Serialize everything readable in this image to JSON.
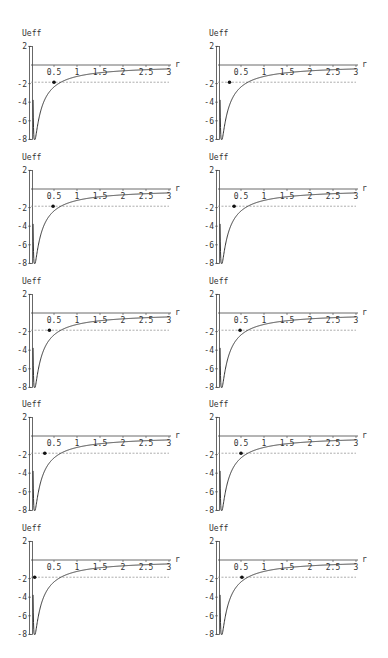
{
  "chart_data": [
    {
      "type": "line",
      "panel": "row1-left",
      "ylabel": "Ueff",
      "xlabel": "r",
      "xlim": [
        0,
        3
      ],
      "ylim": [
        -8,
        2
      ],
      "xticks": [
        "0.5",
        "1",
        "1.5",
        "2",
        "2.5",
        "3"
      ],
      "yticks": [
        "2",
        "-2",
        "-4",
        "-6",
        "-8"
      ],
      "energy_level": -1.85,
      "point": {
        "r": 0.5,
        "U": -1.85
      }
    },
    {
      "type": "line",
      "panel": "row1-right",
      "ylabel": "Ueff",
      "xlabel": "r",
      "xlim": [
        0,
        3
      ],
      "ylim": [
        -8,
        2
      ],
      "xticks": [
        "0.5",
        "1",
        "1.5",
        "2",
        "2.5",
        "3"
      ],
      "yticks": [
        "2",
        "-2",
        "-4",
        "-6",
        "-8"
      ],
      "energy_level": -1.85,
      "point": {
        "r": 0.25,
        "U": -1.85
      }
    },
    {
      "type": "line",
      "panel": "row2-left",
      "ylabel": "Ueff",
      "xlabel": "r",
      "xlim": [
        0,
        3
      ],
      "ylim": [
        -8,
        2
      ],
      "xticks": [
        "0.5",
        "1",
        "1.5",
        "2",
        "2.5",
        "3"
      ],
      "yticks": [
        "2",
        "-2",
        "-4",
        "-6",
        "-8"
      ],
      "energy_level": -1.85,
      "point": {
        "r": 0.48,
        "U": -1.85
      }
    },
    {
      "type": "line",
      "panel": "row2-right",
      "ylabel": "Ueff",
      "xlabel": "r",
      "xlim": [
        0,
        3
      ],
      "ylim": [
        -8,
        2
      ],
      "xticks": [
        "0.5",
        "1",
        "1.5",
        "2",
        "2.5",
        "3"
      ],
      "yticks": [
        "2",
        "-2",
        "-4",
        "-6",
        "-8"
      ],
      "energy_level": -1.85,
      "point": {
        "r": 0.35,
        "U": -1.85
      }
    },
    {
      "type": "line",
      "panel": "row3-left",
      "ylabel": "Ueff",
      "xlabel": "r",
      "xlim": [
        0,
        3
      ],
      "ylim": [
        -8,
        2
      ],
      "xticks": [
        "0.5",
        "1",
        "1.5",
        "2",
        "2.5",
        "3"
      ],
      "yticks": [
        "2",
        "-2",
        "-4",
        "-6",
        "-8"
      ],
      "energy_level": -1.85,
      "point": {
        "r": 0.4,
        "U": -1.85
      }
    },
    {
      "type": "line",
      "panel": "row3-right",
      "ylabel": "Ueff",
      "xlabel": "r",
      "xlim": [
        0,
        3
      ],
      "ylim": [
        -8,
        2
      ],
      "xticks": [
        "0.5",
        "1",
        "1.5",
        "2",
        "2.5",
        "3"
      ],
      "yticks": [
        "2",
        "-2",
        "-4",
        "-6",
        "-8"
      ],
      "energy_level": -1.85,
      "point": {
        "r": 0.48,
        "U": -1.85
      }
    },
    {
      "type": "line",
      "panel": "row4-left",
      "ylabel": "Ueff",
      "xlabel": "r",
      "xlim": [
        0,
        3
      ],
      "ylim": [
        -8,
        2
      ],
      "xticks": [
        "0.5",
        "1",
        "1.5",
        "2",
        "2.5",
        "3"
      ],
      "yticks": [
        "2",
        "-2",
        "-4",
        "-6",
        "-8"
      ],
      "energy_level": -1.85,
      "point": {
        "r": 0.3,
        "U": -1.85
      }
    },
    {
      "type": "line",
      "panel": "row4-right",
      "ylabel": "Ueff",
      "xlabel": "r",
      "xlim": [
        0,
        3
      ],
      "ylim": [
        -8,
        2
      ],
      "xticks": [
        "0.5",
        "1",
        "1.5",
        "2",
        "2.5",
        "3"
      ],
      "yticks": [
        "2",
        "-2",
        "-4",
        "-6",
        "-8"
      ],
      "energy_level": -1.85,
      "point": {
        "r": 0.5,
        "U": -1.85
      }
    },
    {
      "type": "line",
      "panel": "row5-left",
      "ylabel": "Ueff",
      "xlabel": "r",
      "xlim": [
        0,
        3
      ],
      "ylim": [
        -8,
        2
      ],
      "xticks": [
        "0.5",
        "1",
        "1.5",
        "2",
        "2.5",
        "3"
      ],
      "yticks": [
        "2",
        "-2",
        "-4",
        "-6",
        "-8"
      ],
      "energy_level": -1.85,
      "point": {
        "r": 0.08,
        "U": -1.85
      }
    },
    {
      "type": "line",
      "panel": "row5-right",
      "ylabel": "Ueff",
      "xlabel": "r",
      "xlim": [
        0,
        3
      ],
      "ylim": [
        -8,
        2
      ],
      "xticks": [
        "0.5",
        "1",
        "1.5",
        "2",
        "2.5",
        "3"
      ],
      "yticks": [
        "2",
        "-2",
        "-4",
        "-6",
        "-8"
      ],
      "energy_level": -1.85,
      "point": {
        "r": 0.52,
        "U": -1.85
      }
    }
  ],
  "layout": {
    "columns_x": [
      31,
      218
    ],
    "rows_zero_y": [
      65,
      189,
      313,
      436,
      560
    ],
    "px_per_r": 46,
    "px_per_U": 9.3
  },
  "colors": {
    "curve": "#333333",
    "axis": "#444444",
    "dashed": "#888888",
    "point": "#111111"
  }
}
